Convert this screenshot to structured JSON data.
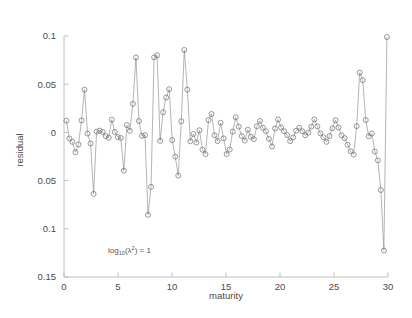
{
  "figure": {
    "background_color": "#ffffff",
    "axis_color": "#b9b9b9",
    "line_color": "#8c8c8c",
    "marker_color": "#6e6e6e",
    "marker_shape": "circle"
  },
  "annotation": {
    "base": "log",
    "subscript": "10",
    "middle": "(λ",
    "superscript": "2",
    "tail": ") = 1",
    "full_text": "log10(λ²) = 1"
  },
  "chart_data": {
    "type": "line",
    "title": "",
    "subtitle": "",
    "xlabel": "maturity",
    "ylabel": "residual",
    "xlim": [
      0,
      30
    ],
    "ylim": [
      -0.15,
      0.1
    ],
    "xticks": [
      0,
      5,
      10,
      15,
      20,
      25,
      30
    ],
    "xticklabels": [
      "0",
      "5",
      "10",
      "15",
      "20",
      "25",
      "30"
    ],
    "yticks": [
      0.1,
      0.05,
      0,
      -0.05,
      -0.1,
      -0.15
    ],
    "yticklabels": [
      "0.1",
      "0.05",
      "0",
      "0.05",
      "0.1",
      "0.15"
    ],
    "grid": false,
    "legend": null,
    "legend_position": "none",
    "marker": "o",
    "linestyle": "-",
    "annotations": [
      {
        "text": "log10(λ²) = 1",
        "x": 4.2,
        "y": -0.108
      }
    ],
    "series": [
      {
        "name": "residual",
        "x": [
          0.22,
          0.5,
          0.78,
          1.06,
          1.34,
          1.62,
          1.9,
          2.18,
          2.46,
          2.74,
          3.02,
          3.3,
          3.58,
          3.86,
          4.14,
          4.42,
          4.7,
          4.98,
          5.26,
          5.54,
          5.82,
          6.1,
          6.38,
          6.66,
          6.94,
          7.22,
          7.5,
          7.78,
          8.06,
          8.34,
          8.62,
          8.9,
          9.18,
          9.46,
          9.74,
          10.02,
          10.3,
          10.58,
          10.86,
          11.14,
          11.42,
          11.7,
          11.98,
          12.26,
          12.54,
          12.82,
          13.1,
          13.38,
          13.66,
          13.94,
          14.22,
          14.5,
          14.78,
          15.06,
          15.34,
          15.62,
          15.9,
          16.18,
          16.46,
          16.74,
          17.02,
          17.3,
          17.58,
          17.86,
          18.14,
          18.42,
          18.7,
          18.98,
          19.26,
          19.54,
          19.82,
          20.1,
          20.38,
          20.66,
          20.94,
          21.22,
          21.5,
          21.78,
          22.06,
          22.34,
          22.62,
          22.9,
          23.18,
          23.46,
          23.74,
          24.02,
          24.3,
          24.58,
          24.86,
          25.14,
          25.42,
          25.7,
          25.98,
          26.26,
          26.54,
          26.82,
          27.1,
          27.38,
          27.66,
          27.94,
          28.22,
          28.5,
          28.78,
          29.06,
          29.34,
          29.62,
          29.9
        ],
        "values": [
          0.0122,
          -0.0063,
          -0.0098,
          -0.0206,
          -0.0125,
          0.0124,
          0.0443,
          -0.0012,
          -0.0115,
          -0.0638,
          0.0008,
          0.0018,
          0.0005,
          -0.0038,
          -0.0055,
          0.0133,
          0.0005,
          -0.0048,
          -0.0058,
          -0.0397,
          0.0075,
          0.0016,
          0.0296,
          0.0777,
          0.0118,
          -0.0035,
          -0.0028,
          -0.0855,
          -0.0565,
          0.0779,
          0.08,
          -0.0088,
          0.0209,
          0.0362,
          0.0448,
          -0.008,
          -0.0251,
          -0.0448,
          0.0116,
          0.0855,
          0.0443,
          -0.0092,
          -0.0017,
          -0.0105,
          0.0022,
          -0.018,
          -0.0225,
          0.0128,
          0.0191,
          -0.003,
          -0.009,
          0.01,
          -0.0062,
          -0.0225,
          -0.0178,
          0.0008,
          0.0157,
          0.006,
          -0.0038,
          -0.0085,
          0.0028,
          -0.0045,
          -0.007,
          0.0064,
          0.0119,
          0.0048,
          0.0012,
          -0.0068,
          -0.0145,
          0.0042,
          0.0134,
          0.0052,
          0.0012,
          -0.0028,
          -0.009,
          -0.0052,
          0.0017,
          0.0048,
          0.0012,
          -0.003,
          -0.0002,
          0.006,
          0.0135,
          0.0063,
          -0.001,
          -0.005,
          -0.0098,
          -0.0038,
          0.0043,
          0.0126,
          0.005,
          -0.003,
          -0.006,
          -0.0128,
          -0.0195,
          -0.023,
          0.0065,
          0.062,
          0.0542,
          0.0128,
          -0.004,
          -0.0012,
          -0.0198,
          -0.029,
          -0.0598,
          -0.1225,
          0.099
        ]
      }
    ]
  }
}
